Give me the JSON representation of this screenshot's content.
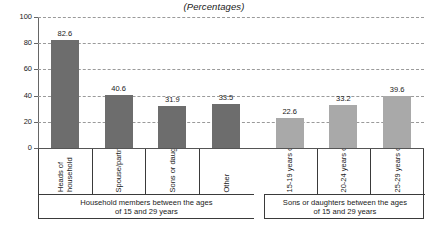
{
  "chart_data": {
    "type": "bar",
    "title": "(Percentages)",
    "xlabel": "",
    "ylabel": "",
    "ylim": [
      0,
      100
    ],
    "yticks": [
      "0",
      "20",
      "40",
      "60",
      "80",
      "100"
    ],
    "grid": true,
    "legend": "none",
    "categories": [
      "Heads of household",
      "Spouse/partner",
      "Sons or daughters",
      "Other",
      "15-19 years of age",
      "20-24 years of age",
      "25-29 years of age"
    ],
    "values": [
      82.6,
      40.6,
      31.9,
      33.5,
      22.6,
      33.2,
      39.6
    ],
    "value_labels": [
      "82.6",
      "40.6",
      "31.9",
      "33.5",
      "22.6",
      "33.2",
      "39.6"
    ],
    "groups": [
      {
        "caption": "Household members between the ages of 15 and 29 years",
        "caption_line1": "Household members between the ages",
        "caption_line2": "of 15 and 29 years",
        "color": "#6d6d6d",
        "categories": [
          "Heads of household",
          "Spouse/partner",
          "Sons or daughters",
          "Other"
        ],
        "values": [
          82.6,
          40.6,
          31.9,
          33.5
        ]
      },
      {
        "caption": "Sons or daughters between the ages of 15 and 29 years",
        "caption_line1": "Sons or daughters between the ages",
        "caption_line2": "of 15 and 29 years",
        "color": "#a9a9a9",
        "categories": [
          "15-19 years of age",
          "20-24 years of age",
          "25-29 years of age"
        ],
        "values": [
          22.6,
          33.2,
          39.6
        ]
      }
    ]
  },
  "colors": {
    "bar_dark": "#6d6d6d",
    "bar_light": "#a9a9a9",
    "gridline": "#9a9a9a",
    "axis": "#666666",
    "table_border": "#3a3a3a",
    "text": "#1a1a1a",
    "background": "#ffffff"
  },
  "cat_labels": {
    "c0_line1": "Heads of",
    "c0_line2": "household",
    "c1": "Spouse/partner",
    "c2": "Sons or daughters",
    "c3": "Other",
    "c4": "15-19 years of age",
    "c5": "20-24 years of age",
    "c6": "25-29 years of age"
  }
}
